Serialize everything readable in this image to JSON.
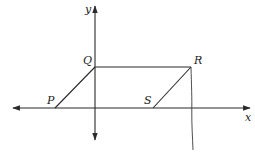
{
  "diagram": {
    "type": "coordinate-plane parallelogram",
    "axes": {
      "x_label": "x",
      "y_label": "y",
      "origin": [
        95,
        108
      ],
      "x_axis": {
        "from": [
          13,
          108
        ],
        "to": [
          250,
          108
        ]
      },
      "y_axis": {
        "from": [
          95,
          140
        ],
        "to": [
          95,
          6
        ]
      }
    },
    "points": [
      {
        "name": "P",
        "label": "P",
        "pos": [
          55,
          108
        ],
        "label_pos": [
          47,
          104
        ]
      },
      {
        "name": "Q",
        "label": "Q",
        "pos": [
          95,
          67
        ],
        "label_pos": [
          83,
          64
        ]
      },
      {
        "name": "R",
        "label": "R",
        "pos": [
          191,
          67
        ],
        "label_pos": [
          195,
          64
        ]
      },
      {
        "name": "S",
        "label": "S",
        "pos": [
          153,
          108
        ],
        "label_pos": [
          144,
          104
        ]
      }
    ],
    "segments": [
      [
        "P",
        "Q"
      ],
      [
        "Q",
        "R"
      ],
      [
        "R",
        "S"
      ]
    ],
    "annotation": {
      "description": "hand-drawn vertical line from R downward through x-axis",
      "from": [
        191,
        67
      ],
      "to": [
        193,
        150
      ]
    },
    "colors": {
      "line": "#2a2a2a",
      "text": "#222222",
      "background": "#ffffff"
    }
  }
}
